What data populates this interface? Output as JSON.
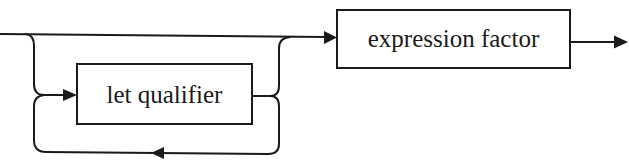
{
  "diagram": {
    "type": "syntax-railroad",
    "nodes": {
      "let_qualifier": {
        "label": "let qualifier"
      },
      "expression_factor": {
        "label": "expression factor"
      }
    },
    "edges": [
      {
        "from": "entry",
        "to": "expression_factor",
        "kind": "bypass"
      },
      {
        "from": "entry",
        "to": "let_qualifier",
        "kind": "optional-branch"
      },
      {
        "from": "let_qualifier",
        "to": "let_qualifier",
        "kind": "repeat-loop"
      },
      {
        "from": "let_qualifier",
        "to": "expression_factor",
        "kind": "merge"
      },
      {
        "from": "expression_factor",
        "to": "exit",
        "kind": "sequence"
      }
    ],
    "colors": {
      "stroke": "#1a1a1a",
      "background": "#ffffff"
    }
  }
}
